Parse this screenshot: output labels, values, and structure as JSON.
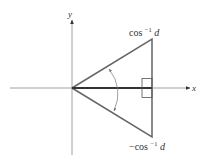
{
  "diagram": {
    "axes": {
      "x_label": "x",
      "y_label": "y"
    },
    "labels": {
      "top_angle": {
        "prefix": "cos",
        "exponent": "−1",
        "var": "d"
      },
      "bottom_angle": {
        "prefix": "−cos",
        "exponent": "−1",
        "var": "d"
      }
    },
    "colors": {
      "axis": "#888888",
      "triangle": "#666666",
      "bisector": "#333333",
      "text": "#333333"
    },
    "shapes": [
      "x-axis",
      "y-axis",
      "cone-triangle",
      "right-angle-marker",
      "double-arrow-arc",
      "bisector-segment"
    ]
  }
}
